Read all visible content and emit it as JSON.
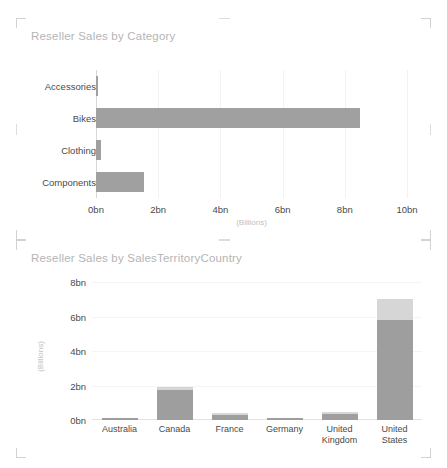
{
  "chart_data": [
    {
      "type": "bar",
      "orientation": "horizontal",
      "title": "Reseller Sales by Category",
      "xlabel": "(Billions)",
      "ylabel": "",
      "categories": [
        "Accessories",
        "Bikes",
        "Clothing",
        "Components"
      ],
      "series": [
        {
          "name": "Reseller Sales",
          "color": "#a0a0a0",
          "values": [
            0.02,
            8.5,
            0.16,
            1.55
          ]
        }
      ],
      "values": [
        0.02,
        8.5,
        0.16,
        1.55
      ],
      "xlim": [
        0,
        10
      ],
      "xticks": [
        0,
        2,
        4,
        6,
        8,
        10
      ],
      "xtick_labels": [
        "0bn",
        "2bn",
        "4bn",
        "6bn",
        "8bn",
        "10bn"
      ],
      "grid": true,
      "legend": "none"
    },
    {
      "type": "bar",
      "orientation": "vertical",
      "stacked": true,
      "title": "Reseller Sales by SalesTerritoryCountry",
      "xlabel": "",
      "ylabel": "(Billions)",
      "categories": [
        "Australia",
        "Canada",
        "France",
        "Germany",
        "United Kingdom",
        "United States"
      ],
      "series": [
        {
          "name": "Primary",
          "color": "#9e9e9e",
          "values": [
            0.05,
            1.72,
            0.27,
            0.06,
            0.32,
            5.8
          ]
        },
        {
          "name": "Secondary",
          "color": "#d6d6d6",
          "values": [
            0.0,
            0.18,
            0.03,
            0.0,
            0.04,
            1.2
          ]
        }
      ],
      "totals": [
        0.05,
        1.9,
        0.3,
        0.06,
        0.36,
        7.0
      ],
      "ylim": [
        0,
        8
      ],
      "yticks": [
        0,
        2,
        4,
        6,
        8
      ],
      "ytick_labels": [
        "0bn",
        "2bn",
        "4bn",
        "6bn",
        "8bn"
      ],
      "grid": true,
      "legend": "none"
    }
  ],
  "colors": {
    "title": "#b5b5b5",
    "tick": "#4a4a4a",
    "axis_caption": "#c0c0c0",
    "gridline": "#f2f2f2",
    "corner": "#d2d2d2",
    "bar_primary": "#9e9e9e",
    "bar_secondary": "#d6d6d6",
    "background": "#ffffff"
  },
  "tiles": [
    {
      "name": "reseller-sales-by-category"
    },
    {
      "name": "reseller-sales-by-salesterritorycountry"
    }
  ]
}
